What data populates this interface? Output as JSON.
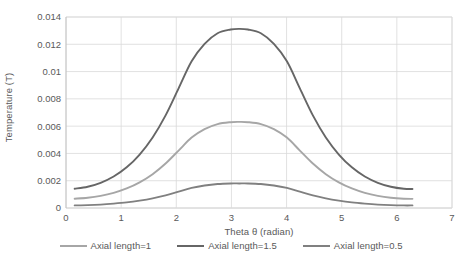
{
  "chart_data": {
    "type": "line",
    "title": "",
    "xlabel": "Theta θ (radian)",
    "ylabel": "Temperature (T)",
    "xlim": [
      0,
      7
    ],
    "ylim": [
      0,
      0.014
    ],
    "xticks": [
      "0",
      "1",
      "2",
      "3",
      "4",
      "5",
      "6",
      "7"
    ],
    "xtick_values": [
      0,
      1,
      2,
      3,
      4,
      5,
      6,
      7
    ],
    "yticks": [
      "0",
      "0.002",
      "0.004",
      "0.006",
      "0.008",
      "0.01",
      "0.012",
      "0.014"
    ],
    "ytick_values": [
      0,
      0.002,
      0.004,
      0.006,
      0.008,
      0.01,
      0.012,
      0.014
    ],
    "grid": true,
    "legend_position": "bottom",
    "x": [
      0.157,
      0.393,
      0.628,
      0.864,
      1.1,
      1.335,
      1.571,
      1.806,
      2.042,
      2.278,
      2.513,
      2.749,
      2.985,
      3.142,
      3.299,
      3.534,
      3.77,
      4.006,
      4.241,
      4.477,
      4.712,
      4.948,
      5.184,
      5.419,
      5.655,
      5.891,
      6.126,
      6.283
    ],
    "series": [
      {
        "name": "Axial length=1",
        "color": "#a6a6a6",
        "values": [
          0.00068,
          0.00075,
          0.00089,
          0.00111,
          0.00143,
          0.00188,
          0.00248,
          0.00326,
          0.00421,
          0.00516,
          0.00578,
          0.00615,
          0.00629,
          0.00631,
          0.00629,
          0.00615,
          0.00578,
          0.00516,
          0.00421,
          0.00326,
          0.00248,
          0.00188,
          0.00143,
          0.00111,
          0.00089,
          0.00075,
          0.00068,
          0.00067
        ]
      },
      {
        "name": "Axial length=1.5",
        "color": "#666666",
        "values": [
          0.00141,
          0.00156,
          0.00185,
          0.00231,
          0.00298,
          0.00392,
          0.00517,
          0.00679,
          0.00877,
          0.01075,
          0.01203,
          0.01281,
          0.01308,
          0.01313,
          0.01308,
          0.01281,
          0.01203,
          0.01075,
          0.00877,
          0.00679,
          0.00517,
          0.00392,
          0.00298,
          0.00231,
          0.00185,
          0.00156,
          0.00141,
          0.00139
        ]
      },
      {
        "name": "Axial length=0.5",
        "color": "#808080",
        "values": [
          0.00019,
          0.00021,
          0.00025,
          0.00032,
          0.00041,
          0.00054,
          0.00071,
          0.00093,
          0.0012,
          0.00147,
          0.00165,
          0.00176,
          0.0018,
          0.0018,
          0.0018,
          0.00176,
          0.00165,
          0.00147,
          0.0012,
          0.00093,
          0.00071,
          0.00054,
          0.00041,
          0.00032,
          0.00025,
          0.00021,
          0.00019,
          0.00019
        ]
      }
    ]
  },
  "legend": {
    "items": [
      {
        "label": "Axial length=1",
        "color": "#a6a6a6"
      },
      {
        "label": "Axial length=1.5",
        "color": "#666666"
      },
      {
        "label": "Axial length=0.5",
        "color": "#808080"
      }
    ]
  }
}
